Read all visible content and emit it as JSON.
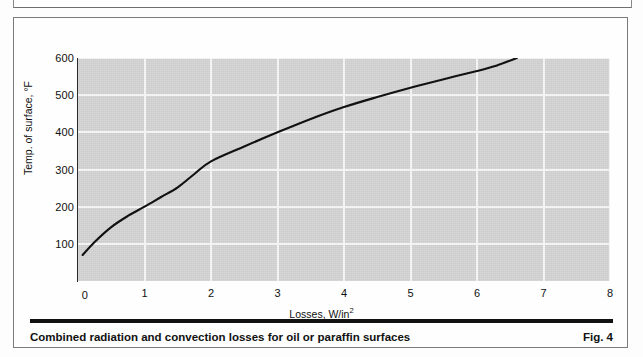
{
  "figure": {
    "caption": "Combined radiation and convection losses for oil or paraffin surfaces",
    "figure_number": "Fig. 4"
  },
  "chart_data": {
    "type": "line",
    "title": "",
    "subtitle": "",
    "xlabel": "Losses, W/in",
    "xlabel_superscript": "2",
    "ylabel": "Temp. of surface, °F",
    "xlim": [
      0,
      8
    ],
    "ylim": [
      0,
      600
    ],
    "xticks": [
      "0",
      "1",
      "2",
      "3",
      "4",
      "5",
      "6",
      "7",
      "8"
    ],
    "xtick_values": [
      0,
      1,
      2,
      3,
      4,
      5,
      6,
      7,
      8
    ],
    "yticks": [
      "100",
      "200",
      "300",
      "400",
      "500",
      "600"
    ],
    "ytick_values": [
      100,
      200,
      300,
      400,
      500,
      600
    ],
    "grid": true,
    "grid_color": "#f3f3f3",
    "plot_background": "#d6d6d6",
    "legend": null,
    "series": [
      {
        "name": "Combined radiation and convection losses",
        "color": "#111111",
        "x": [
          0.07,
          0.25,
          0.5,
          0.75,
          1.0,
          1.25,
          1.5,
          1.75,
          2.0,
          2.5,
          3.0,
          3.5,
          4.0,
          4.5,
          5.0,
          5.5,
          6.0,
          6.3,
          6.6
        ],
        "y": [
          70,
          105,
          145,
          175,
          200,
          226,
          252,
          288,
          322,
          362,
          400,
          436,
          468,
          495,
          520,
          543,
          565,
          580,
          600
        ]
      }
    ]
  }
}
